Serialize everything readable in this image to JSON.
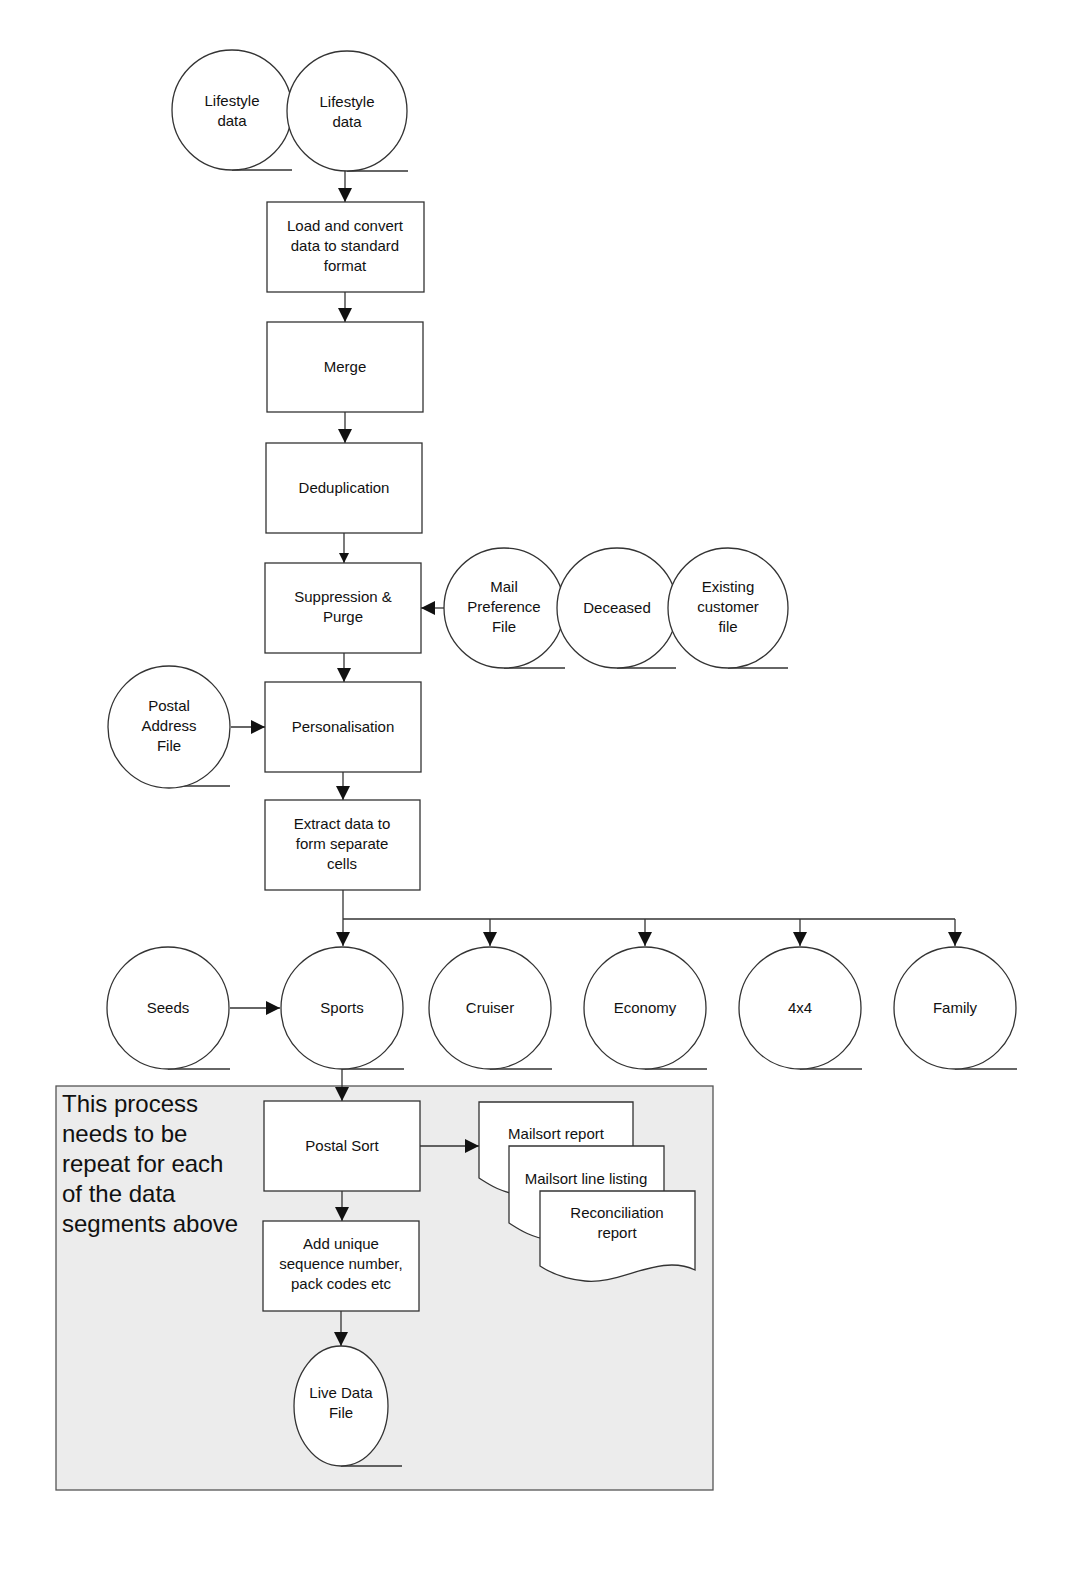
{
  "diagram": {
    "type": "flowchart",
    "sources": [
      {
        "id": "lifestyle1",
        "label": [
          "Lifestyle",
          "data"
        ]
      },
      {
        "id": "lifestyle2",
        "label": [
          "Lifestyle",
          "data"
        ]
      }
    ],
    "processes": [
      {
        "id": "load",
        "label": [
          "Load and convert",
          "data to standard",
          "format"
        ]
      },
      {
        "id": "merge",
        "label": [
          "Merge"
        ]
      },
      {
        "id": "dedup",
        "label": [
          "Deduplication"
        ]
      },
      {
        "id": "suppression",
        "label": [
          "Suppression &",
          "Purge"
        ]
      },
      {
        "id": "personalisation",
        "label": [
          "Personalisation"
        ]
      },
      {
        "id": "extract",
        "label": [
          "Extract data to",
          "form separate",
          "cells"
        ]
      },
      {
        "id": "postalsort",
        "label": [
          "Postal Sort"
        ]
      },
      {
        "id": "addunique",
        "label": [
          "Add unique",
          "sequence number,",
          "pack codes etc"
        ]
      }
    ],
    "suppression_files": [
      {
        "id": "mailpref",
        "label": [
          "Mail",
          "Preference",
          "File"
        ]
      },
      {
        "id": "deceased",
        "label": [
          "Deceased"
        ]
      },
      {
        "id": "existing",
        "label": [
          "Existing",
          "customer",
          "file"
        ]
      }
    ],
    "postal_address": {
      "id": "paf",
      "label": [
        "Postal",
        "Address",
        "File"
      ]
    },
    "segments": [
      {
        "id": "seeds",
        "label": [
          "Seeds"
        ]
      },
      {
        "id": "sports",
        "label": [
          "Sports"
        ]
      },
      {
        "id": "cruiser",
        "label": [
          "Cruiser"
        ]
      },
      {
        "id": "economy",
        "label": [
          "Economy"
        ]
      },
      {
        "id": "4x4",
        "label": [
          "4x4"
        ]
      },
      {
        "id": "family",
        "label": [
          "Family"
        ]
      }
    ],
    "reports": [
      {
        "id": "mailsort",
        "label": [
          "Mailsort report"
        ]
      },
      {
        "id": "lineListing",
        "label": [
          "Mailsort line listing"
        ]
      },
      {
        "id": "reconciliation",
        "label": [
          "Reconciliation",
          "report"
        ]
      }
    ],
    "output": {
      "id": "live",
      "label": [
        "Live Data",
        "File"
      ]
    },
    "note": {
      "lines": [
        "This process",
        "needs to be",
        "repeat for each",
        "of the data",
        "segments above"
      ]
    },
    "edges": [
      [
        "lifestyle2",
        "load"
      ],
      [
        "load",
        "merge"
      ],
      [
        "merge",
        "dedup"
      ],
      [
        "dedup",
        "suppression"
      ],
      [
        "mailpref",
        "suppression"
      ],
      [
        "suppression",
        "personalisation"
      ],
      [
        "paf",
        "personalisation"
      ],
      [
        "personalisation",
        "extract"
      ],
      [
        "extract",
        "sports"
      ],
      [
        "extract",
        "cruiser"
      ],
      [
        "extract",
        "economy"
      ],
      [
        "extract",
        "4x4"
      ],
      [
        "extract",
        "family"
      ],
      [
        "seeds",
        "sports"
      ],
      [
        "sports",
        "postalsort"
      ],
      [
        "postalsort",
        "mailsort"
      ],
      [
        "postalsort",
        "addunique"
      ],
      [
        "addunique",
        "live"
      ]
    ]
  }
}
